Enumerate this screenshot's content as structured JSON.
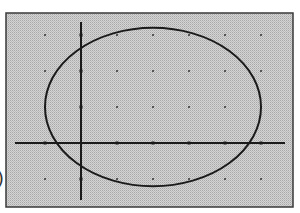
{
  "chart_data": {
    "type": "line",
    "title": "",
    "xlabel": "",
    "ylabel": "",
    "grid": "dots at integer lattice points",
    "xlim": [
      -2,
      5.6
    ],
    "ylim": [
      -1.6,
      3.3
    ],
    "x_ticks": [
      -1,
      0,
      1,
      2,
      3,
      4,
      5
    ],
    "y_ticks": [
      -1,
      0,
      1,
      2,
      3
    ],
    "series": [
      {
        "name": "ellipse",
        "shape": "ellipse",
        "center": [
          2,
          1
        ],
        "rx": 3,
        "ry": 2.2,
        "x_intercepts": [
          -0.67,
          4.67
        ],
        "y_intercepts": [
          -0.6,
          2.6
        ]
      }
    ]
  },
  "side_label": ")",
  "colors": {
    "frame": "#3a3a3a",
    "background": "#c8c8c8",
    "curve": "#1a1a1a",
    "axis": "#1a1a1a",
    "grid_dot": "#555555"
  }
}
